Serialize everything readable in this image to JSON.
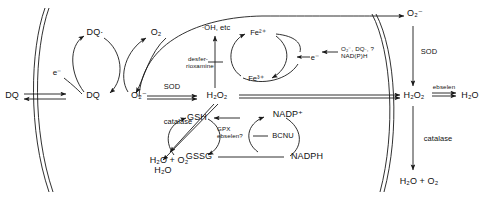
{
  "diagram": {
    "type": "biochemical-pathway",
    "stroke_color": "#1a1a1a",
    "text_color": "#111111",
    "background": "#ffffff"
  },
  "species": {
    "dq_extracellular": "DQ",
    "dq_intracellular": "DQ",
    "dq_radical": "DQ·",
    "electron_membrane": "e⁻",
    "oxygen": "O₂",
    "superoxide_cyto": "O₂⁻",
    "superoxide_extra": "O₂⁻",
    "hydrogen_peroxide_cyto": "H₂O₂",
    "hydrogen_peroxide_extra": "H₂O₂",
    "water_extra": "H₂O",
    "hydroxyl_radical": "·OH, etc",
    "iron_ferrous": "Fe²⁺",
    "iron_ferric": "Fe³⁺",
    "electron_fenton": "e⁻",
    "reductants": "O₂⁻, DQ·, ?\nNAD(P)H",
    "glutathione_reduced": "GSH",
    "glutathione_oxidized": "GSSG",
    "nadp_plus": "NADP⁺",
    "nadph": "NADPH",
    "water_gpx": "H₂O",
    "water_oxygen_catalase_cyto": "H₂O + O₂",
    "water_oxygen_catalase_extra": "H₂O + O₂"
  },
  "enzymes": {
    "sod_cytosolic": "SOD",
    "sod_extracellular": "SOD",
    "catalase_cytosolic": "catalase",
    "catalase_extracellular": "catalase",
    "gpx_label": "GPX\nebselen?",
    "ebselen_extracellular": "ebselen"
  },
  "inhibitors": {
    "desferrioxamine": "desfer-\nrioxamine",
    "bcnu": "BCNU"
  }
}
